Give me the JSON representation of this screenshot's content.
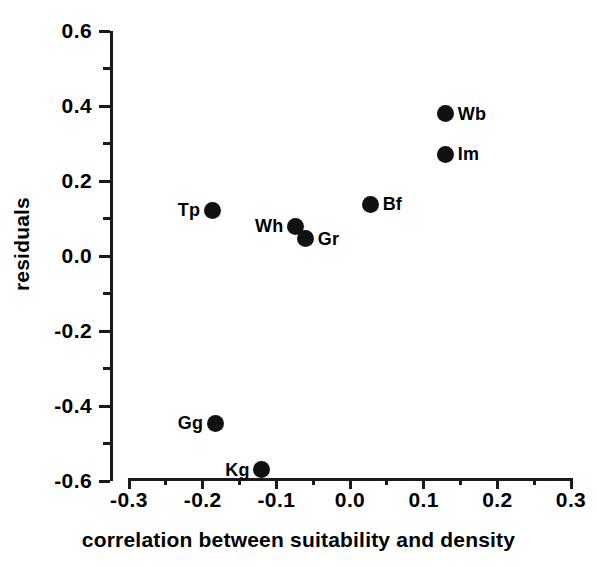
{
  "chart_data": {
    "type": "scatter",
    "title": "",
    "xlabel": "correlation between suitability and density",
    "ylabel": "residuals",
    "xlim": [
      -0.3,
      0.3
    ],
    "ylim": [
      -0.6,
      0.6
    ],
    "grid": false,
    "legend": "none",
    "x_ticks": [
      "-0.3",
      "-0.2",
      "-0.1",
      "0.0",
      "0.1",
      "0.2",
      "0.3"
    ],
    "x_tick_values": [
      -0.3,
      -0.2,
      -0.1,
      0.0,
      0.1,
      0.2,
      0.3
    ],
    "x_minor_tick_values": [
      -0.25,
      -0.15,
      -0.05,
      0.05,
      0.15,
      0.25
    ],
    "y_ticks": [
      "0.6",
      "0.4",
      "0.2",
      "0.0",
      "-0.2",
      "-0.4",
      "-0.6"
    ],
    "y_tick_values": [
      0.6,
      0.4,
      0.2,
      0.0,
      -0.2,
      -0.4,
      -0.6
    ],
    "y_minor_tick_values": [
      0.5,
      0.3,
      0.1,
      -0.1,
      -0.3,
      -0.5
    ],
    "marker": "filled-circle",
    "marker_color": "#111111",
    "points": [
      {
        "label": "Wb",
        "x": 0.13,
        "y": 0.38,
        "label_pos": "right"
      },
      {
        "label": "Im",
        "x": 0.13,
        "y": 0.272,
        "label_pos": "right"
      },
      {
        "label": "Bf",
        "x": 0.028,
        "y": 0.138,
        "label_pos": "right"
      },
      {
        "label": "Tp",
        "x": -0.187,
        "y": 0.122,
        "label_pos": "left"
      },
      {
        "label": "Wh",
        "x": -0.074,
        "y": 0.08,
        "label_pos": "left"
      },
      {
        "label": "Gr",
        "x": -0.06,
        "y": 0.046,
        "label_pos": "right"
      },
      {
        "label": "Gg",
        "x": -0.183,
        "y": -0.446,
        "label_pos": "left"
      },
      {
        "label": "Kg",
        "x": -0.12,
        "y": -0.57,
        "label_pos": "left"
      }
    ]
  }
}
